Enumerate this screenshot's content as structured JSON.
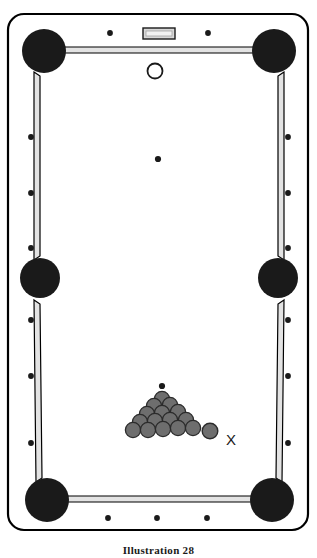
{
  "figure": {
    "caption": "Illustration 28"
  },
  "colors": {
    "table_felt": "#ffffff",
    "frame_outline": "#000000",
    "rail_fill": "#e3e3e3",
    "pocket": "#1a1a1a",
    "ball_fill": "#6e6e6e",
    "ball_outline": "#2b2b2b",
    "cue_ball_fill": "#ffffff",
    "cue_ball_outline": "#1a1a1a",
    "diamond": "#1a1a1a",
    "plate_fill": "#d8d8d8",
    "label_text": "#1a1a1a",
    "background": "#ffffff"
  },
  "labels": {
    "target_ball_marker": "X"
  },
  "table": {
    "frame": {
      "x": 8,
      "y": 14,
      "width": 300,
      "height": 516,
      "corner_radius": 16,
      "stroke_width": 2.2
    },
    "playfield": {
      "x": 38,
      "y": 44,
      "width": 240,
      "height": 456
    },
    "name_plate": {
      "x": 143,
      "y": 28,
      "width": 32,
      "height": 11
    }
  },
  "pockets": [
    {
      "name": "top-left-pocket",
      "cx": 44,
      "cy": 51,
      "r": 22
    },
    {
      "name": "top-right-pocket",
      "cx": 274,
      "cy": 51,
      "r": 22
    },
    {
      "name": "side-left-pocket",
      "cx": 40,
      "cy": 278,
      "r": 20
    },
    {
      "name": "side-right-pocket",
      "cx": 278,
      "cy": 278,
      "r": 20
    },
    {
      "name": "bottom-left-pocket",
      "cx": 47,
      "cy": 500,
      "r": 22
    },
    {
      "name": "bottom-right-pocket",
      "cx": 272,
      "cy": 500,
      "r": 22
    }
  ],
  "rails": [
    {
      "name": "top-rail",
      "points": "62,47 258,47 262,53 58,53"
    },
    {
      "name": "left-upper-rail",
      "points": "34,72 40,76 40,256 34,260"
    },
    {
      "name": "left-lower-rail",
      "points": "34,300 40,304 42,478 36,482"
    },
    {
      "name": "right-upper-rail",
      "points": "284,72 278,76 278,256 284,260"
    },
    {
      "name": "right-lower-rail",
      "points": "284,300 278,304 276,478 282,482"
    },
    {
      "name": "bottom-rail",
      "points": "64,496 254,496 258,502 60,502"
    }
  ],
  "diamonds": [
    {
      "name": "diamond-top-left",
      "cx": 110,
      "cy": 33,
      "r": 2.9
    },
    {
      "name": "diamond-top-right",
      "cx": 208,
      "cy": 33,
      "r": 2.9
    },
    {
      "name": "diamond-left-1",
      "cx": 31,
      "cy": 137,
      "r": 2.9
    },
    {
      "name": "diamond-left-2",
      "cx": 31,
      "cy": 193,
      "r": 2.9
    },
    {
      "name": "diamond-left-3",
      "cx": 31,
      "cy": 248,
      "r": 2.9
    },
    {
      "name": "diamond-left-4",
      "cx": 31,
      "cy": 320,
      "r": 2.9
    },
    {
      "name": "diamond-left-5",
      "cx": 31,
      "cy": 376,
      "r": 2.9
    },
    {
      "name": "diamond-left-6",
      "cx": 31,
      "cy": 443,
      "r": 2.9
    },
    {
      "name": "diamond-right-1",
      "cx": 288,
      "cy": 137,
      "r": 2.9
    },
    {
      "name": "diamond-right-2",
      "cx": 288,
      "cy": 193,
      "r": 2.9
    },
    {
      "name": "diamond-right-3",
      "cx": 288,
      "cy": 248,
      "r": 2.9
    },
    {
      "name": "diamond-right-4",
      "cx": 288,
      "cy": 320,
      "r": 2.9
    },
    {
      "name": "diamond-right-5",
      "cx": 288,
      "cy": 376,
      "r": 2.9
    },
    {
      "name": "diamond-right-6",
      "cx": 288,
      "cy": 443,
      "r": 2.9
    },
    {
      "name": "diamond-bottom-left",
      "cx": 108,
      "cy": 518,
      "r": 2.9
    },
    {
      "name": "diamond-bottom-center",
      "cx": 157,
      "cy": 518,
      "r": 2.9
    },
    {
      "name": "diamond-bottom-right",
      "cx": 207,
      "cy": 518,
      "r": 2.9
    }
  ],
  "spots": [
    {
      "name": "center-spot",
      "cx": 158,
      "cy": 159,
      "r": 3.1
    },
    {
      "name": "foot-spot",
      "cx": 162,
      "cy": 386,
      "r": 3.1
    }
  ],
  "cue_ball": {
    "name": "cue-ball",
    "cx": 155,
    "cy": 71,
    "r": 7.5
  },
  "target_ball": {
    "name": "target-ball",
    "cx": 210,
    "cy": 431,
    "r": 7.8
  },
  "marker_x": {
    "x": 226,
    "y": 445
  },
  "rack": {
    "ball_radius": 7.6,
    "rows": [
      {
        "row": 1,
        "balls": [
          {
            "cx": 162,
            "cy": 399
          }
        ]
      },
      {
        "row": 2,
        "balls": [
          {
            "cx": 154,
            "cy": 406
          },
          {
            "cx": 170,
            "cy": 405
          }
        ]
      },
      {
        "row": 3,
        "balls": [
          {
            "cx": 147,
            "cy": 414
          },
          {
            "cx": 162,
            "cy": 413
          },
          {
            "cx": 178,
            "cy": 412
          }
        ]
      },
      {
        "row": 4,
        "balls": [
          {
            "cx": 140,
            "cy": 422
          },
          {
            "cx": 155,
            "cy": 421
          },
          {
            "cx": 170,
            "cy": 420
          },
          {
            "cx": 186,
            "cy": 420
          }
        ]
      },
      {
        "row": 5,
        "balls": [
          {
            "cx": 133,
            "cy": 430
          },
          {
            "cx": 148,
            "cy": 430
          },
          {
            "cx": 163,
            "cy": 429
          },
          {
            "cx": 178,
            "cy": 428
          },
          {
            "cx": 193,
            "cy": 428
          }
        ]
      }
    ]
  }
}
